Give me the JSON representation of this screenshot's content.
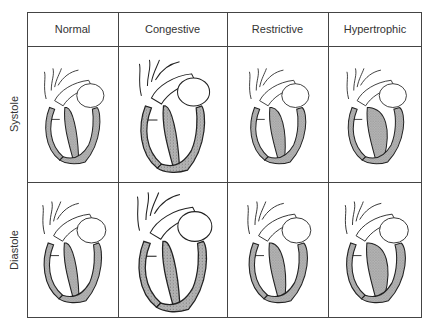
{
  "columns": [
    "Normal",
    "Congestive",
    "Restrictive",
    "Hypertrophic"
  ],
  "rows": [
    "Systole",
    "Diastole"
  ],
  "cells": [
    {
      "row": "Systole",
      "column": "Normal",
      "illustration": "heart-cross-section"
    },
    {
      "row": "Systole",
      "column": "Congestive",
      "illustration": "heart-cross-section"
    },
    {
      "row": "Systole",
      "column": "Restrictive",
      "illustration": "heart-cross-section"
    },
    {
      "row": "Systole",
      "column": "Hypertrophic",
      "illustration": "heart-cross-section"
    },
    {
      "row": "Diastole",
      "column": "Normal",
      "illustration": "heart-cross-section"
    },
    {
      "row": "Diastole",
      "column": "Congestive",
      "illustration": "heart-cross-section"
    },
    {
      "row": "Diastole",
      "column": "Restrictive",
      "illustration": "heart-cross-section"
    },
    {
      "row": "Diastole",
      "column": "Hypertrophic",
      "illustration": "heart-cross-section"
    }
  ],
  "colors": {
    "wall_fill": "#a8a8a8",
    "line": "#222222",
    "background": "#ffffff"
  }
}
